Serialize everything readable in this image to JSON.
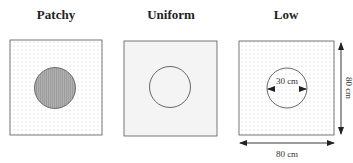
{
  "panels": [
    {
      "title": "Patchy",
      "pattern": "sparse-dots",
      "circle_fill": "#a8a8a8"
    },
    {
      "title": "Uniform",
      "pattern": "dense-dots",
      "circle_fill": "none"
    },
    {
      "title": "Low",
      "pattern": "sparse-dots",
      "circle_fill": "none"
    }
  ],
  "dimensions": {
    "circle_diameter": "30 cm",
    "plot_width": "80 cm",
    "plot_height": "80 cm"
  },
  "colors": {
    "border": "#555555",
    "dot": "#9a9a9a",
    "circle_stroke": "#444444",
    "patchy_fill": "#a8a8a8"
  }
}
